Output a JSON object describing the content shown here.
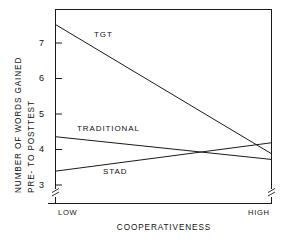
{
  "chart_data": {
    "type": "line",
    "title": "",
    "xlabel": "COOPERATIVENESS",
    "ylabel_line1": "NUMBER OF WORDS GAINED",
    "ylabel_line2": "PRE- TO POSTTEST",
    "categories": [
      "LOW",
      "HIGH"
    ],
    "x_tick_labels": [
      "LOW",
      "HIGH"
    ],
    "y_tick_labels": [
      "3",
      "4",
      "5",
      "6",
      "7"
    ],
    "y_ticks": [
      3,
      4,
      5,
      6,
      7
    ],
    "ylim": [
      2.55,
      7.85
    ],
    "xlim": [
      0,
      1
    ],
    "grid": false,
    "legend_position": "inline-labels",
    "axis_break_y_left": true,
    "axis_break_y_right": true,
    "series": [
      {
        "name": "TGT",
        "values": [
          7.52,
          3.88
        ],
        "label": "TGT"
      },
      {
        "name": "TRADITIONAL",
        "values": [
          4.36,
          3.72
        ],
        "label": "TRADITIONAL"
      },
      {
        "name": "STAD",
        "values": [
          3.39,
          4.19
        ],
        "label": "STAD"
      }
    ],
    "annotations": [
      {
        "text": "TGT",
        "x": 0.24,
        "y": 7.05
      },
      {
        "text": "TRADITIONAL",
        "x": 0.14,
        "y": 4.63
      },
      {
        "text": "STAD",
        "x": 0.3,
        "y": 3.2
      }
    ],
    "colors": {
      "line": "#1a1a1a",
      "axis": "#1a1a1a",
      "background": "#ffffff",
      "text": "#111111"
    }
  }
}
